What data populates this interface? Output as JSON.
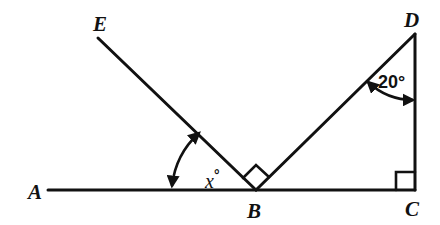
{
  "diagram": {
    "type": "geometry",
    "points": {
      "A": {
        "label": "A",
        "x": 48,
        "y": 190
      },
      "B": {
        "label": "B",
        "x": 256,
        "y": 190
      },
      "C": {
        "label": "C",
        "x": 415,
        "y": 190
      },
      "D": {
        "label": "D",
        "x": 415,
        "y": 34
      },
      "E": {
        "label": "E",
        "x": 98,
        "y": 38
      }
    },
    "segments": [
      [
        "A",
        "C"
      ],
      [
        "B",
        "E"
      ],
      [
        "B",
        "D"
      ],
      [
        "D",
        "C"
      ]
    ],
    "right_angles": [
      {
        "vertex": "B",
        "between": [
          "E",
          "D"
        ]
      },
      {
        "vertex": "C",
        "between": [
          "B",
          "D"
        ]
      }
    ],
    "angles": [
      {
        "vertex": "B",
        "between": [
          "A",
          "E"
        ],
        "label": "x°",
        "label_var": "x",
        "label_deg": "°"
      },
      {
        "vertex": "D",
        "between": [
          "B",
          "C"
        ],
        "label": "20°"
      }
    ]
  },
  "labels": {
    "A": "A",
    "B": "B",
    "C": "C",
    "D": "D",
    "E": "E",
    "angle_x_var": "x",
    "angle_x_deg": "°",
    "angle_d": "20°"
  },
  "colors": {
    "ink": "#111111",
    "background": "#ffffff"
  }
}
